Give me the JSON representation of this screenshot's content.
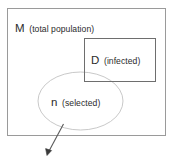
{
  "diagram": {
    "type": "set-diagram",
    "background_color": "#ffffff",
    "stroke_colors": {
      "outer_rect": "#9a9a9a",
      "inner_rect": "#6e6e6e",
      "ellipse": "#c9c9c9",
      "arrow": "#5a5a5a",
      "text": "#2b2b2b"
    },
    "sets": {
      "population": {
        "symbol": "M",
        "paren": "(total population)",
        "shape": "rectangle"
      },
      "infected": {
        "symbol": "D",
        "paren": "(infected)",
        "shape": "rectangle"
      },
      "selected": {
        "symbol": "n",
        "paren": "(selected)",
        "shape": "ellipse"
      }
    },
    "annotation_arrow": {
      "from_label": "n",
      "direction": "down-left",
      "head": "filled"
    },
    "cut_off_caption": ""
  }
}
